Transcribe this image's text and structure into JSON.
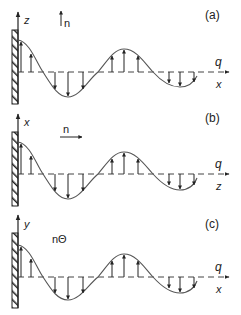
{
  "figure": {
    "colors": {
      "ink": "#222222",
      "curve": "#555555",
      "axis_dash": "#444444",
      "background": "#ffffff"
    },
    "panels": [
      {
        "id": "a",
        "label": "(a)",
        "vertical_axis_label": "z",
        "horizontal_axis_label": "x",
        "wave_label": "q",
        "direction_label": "n",
        "direction_arrow": "up",
        "offset_y": 0
      },
      {
        "id": "b",
        "label": "(b)",
        "vertical_axis_label": "x",
        "horizontal_axis_label": "z",
        "wave_label": "q",
        "direction_label": "n",
        "direction_arrow": "right",
        "offset_y": 102
      },
      {
        "id": "c",
        "label": "(c)",
        "vertical_axis_label": "y",
        "horizontal_axis_label": "x",
        "wave_label": "q",
        "direction_label": "nΘ",
        "direction_arrow": "none",
        "offset_y": 205
      }
    ],
    "wave": {
      "description": "damped standing wave emanating from a hatched wall, with displacement arrows",
      "arrows_x": [
        21,
        31,
        55,
        68,
        83,
        112,
        124,
        138,
        169,
        180,
        194
      ]
    }
  }
}
